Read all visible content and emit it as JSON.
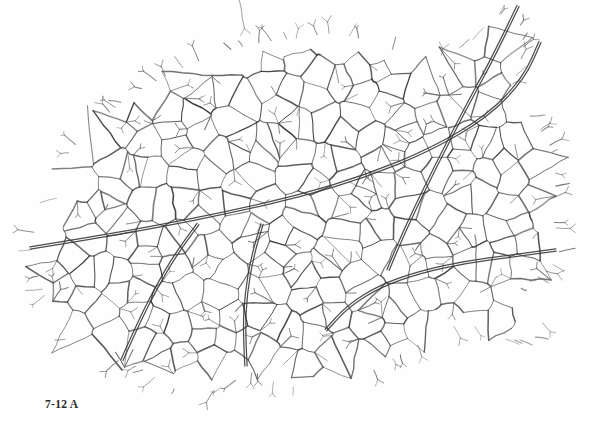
{
  "figure": {
    "caption": "7-12 A",
    "specimen_label": "A",
    "plate_number": "7-12",
    "background_color": "#fefefe",
    "vein_color": "#3a3a3a",
    "minor_vein_color": "#585858",
    "veinlet_color": "#6a6a6a",
    "canvas": {
      "width": 594,
      "height": 434
    }
  },
  "chart_data": {
    "type": "diagram",
    "title": "7-12 A",
    "outline": [
      [
        36,
        262
      ],
      [
        30,
        246
      ],
      [
        35,
        228
      ],
      [
        52,
        204
      ],
      [
        66,
        186
      ],
      [
        60,
        170
      ],
      [
        70,
        150
      ],
      [
        92,
        128
      ],
      [
        110,
        112
      ],
      [
        128,
        96
      ],
      [
        150,
        84
      ],
      [
        172,
        72
      ],
      [
        196,
        62
      ],
      [
        222,
        52
      ],
      [
        250,
        44
      ],
      [
        276,
        40
      ],
      [
        300,
        38
      ],
      [
        326,
        33
      ],
      [
        352,
        36
      ],
      [
        378,
        44
      ],
      [
        400,
        52
      ],
      [
        424,
        58
      ],
      [
        448,
        54
      ],
      [
        470,
        42
      ],
      [
        486,
        28
      ],
      [
        500,
        14
      ],
      [
        512,
        6
      ],
      [
        520,
        22
      ],
      [
        524,
        44
      ],
      [
        520,
        66
      ],
      [
        512,
        86
      ],
      [
        520,
        104
      ],
      [
        534,
        120
      ],
      [
        548,
        140
      ],
      [
        556,
        162
      ],
      [
        556,
        186
      ],
      [
        548,
        208
      ],
      [
        556,
        226
      ],
      [
        562,
        244
      ],
      [
        556,
        262
      ],
      [
        540,
        276
      ],
      [
        520,
        286
      ],
      [
        528,
        300
      ],
      [
        540,
        316
      ],
      [
        546,
        332
      ],
      [
        530,
        340
      ],
      [
        508,
        340
      ],
      [
        486,
        332
      ],
      [
        466,
        322
      ],
      [
        444,
        330
      ],
      [
        420,
        344
      ],
      [
        398,
        356
      ],
      [
        378,
        368
      ],
      [
        360,
        378
      ],
      [
        340,
        386
      ],
      [
        318,
        390
      ],
      [
        296,
        388
      ],
      [
        274,
        382
      ],
      [
        254,
        372
      ],
      [
        236,
        380
      ],
      [
        216,
        390
      ],
      [
        196,
        394
      ],
      [
        176,
        390
      ],
      [
        158,
        380
      ],
      [
        140,
        368
      ],
      [
        122,
        360
      ],
      [
        104,
        364
      ],
      [
        86,
        360
      ],
      [
        70,
        346
      ],
      [
        58,
        330
      ],
      [
        50,
        312
      ],
      [
        44,
        294
      ],
      [
        38,
        278
      ]
    ],
    "primary_veins": [
      {
        "name": "midrib-ascending",
        "path": [
          [
            30,
            248
          ],
          [
            92,
            238
          ],
          [
            160,
            226
          ],
          [
            230,
            212
          ],
          [
            300,
            196
          ],
          [
            366,
            176
          ],
          [
            430,
            150
          ],
          [
            488,
            116
          ],
          [
            524,
            78
          ],
          [
            540,
            42
          ]
        ]
      },
      {
        "name": "secondary-upper-right",
        "path": [
          [
            518,
            6
          ],
          [
            496,
            52
          ],
          [
            470,
            100
          ],
          [
            446,
            146
          ],
          [
            424,
            190
          ],
          [
            404,
            232
          ],
          [
            388,
            270
          ]
        ]
      },
      {
        "name": "secondary-lower-right",
        "path": [
          [
            556,
            250
          ],
          [
            512,
            256
          ],
          [
            466,
            262
          ],
          [
            420,
            272
          ],
          [
            380,
            286
          ],
          [
            348,
            306
          ],
          [
            326,
            330
          ]
        ]
      },
      {
        "name": "secondary-lower-mid",
        "path": [
          [
            246,
            366
          ],
          [
            244,
            330
          ],
          [
            246,
            294
          ],
          [
            252,
            258
          ],
          [
            262,
            224
          ]
        ]
      },
      {
        "name": "secondary-lower-left",
        "path": [
          [
            122,
            360
          ],
          [
            138,
            324
          ],
          [
            156,
            288
          ],
          [
            176,
            254
          ],
          [
            198,
            224
          ]
        ]
      }
    ],
    "areole_count_estimate": 260,
    "veinlet_count_estimate": 140,
    "grid": false,
    "legend": null,
    "axes": null
  },
  "generator": {
    "seed": 20250419,
    "cell_spacing": 26,
    "jitter": 0.46,
    "line_width_major": 2.0,
    "line_width_minor": 1.05,
    "line_width_veinlet": 0.8
  }
}
